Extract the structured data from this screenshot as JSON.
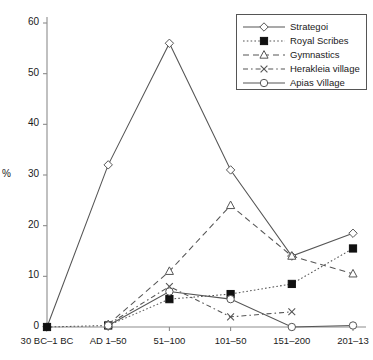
{
  "chart_data": {
    "type": "line",
    "title": "",
    "subtitle": "",
    "xlabel": "",
    "ylabel": "%",
    "ylim": [
      0,
      60
    ],
    "yticks": [
      0,
      10,
      20,
      30,
      40,
      50,
      60
    ],
    "grid": false,
    "legend_position": "top-right",
    "categories": [
      "30 BC–1 BC",
      "AD 1–50",
      "51–100",
      "101–50",
      "151–200",
      "201–13"
    ],
    "series": [
      {
        "name": "Strategoi",
        "marker": "open-diamond",
        "line": "solid",
        "values": [
          0,
          32,
          56,
          31,
          14,
          18.5
        ]
      },
      {
        "name": "Royal Scribes",
        "marker": "filled-square",
        "line": "dotted",
        "values": [
          0,
          0.3,
          5.5,
          6.5,
          8.5,
          15.5
        ]
      },
      {
        "name": "Gymnastics",
        "marker": "open-triangle",
        "line": "dashed",
        "values": [
          null,
          0.5,
          11,
          24,
          14,
          10.5
        ]
      },
      {
        "name": "Herakleia village",
        "marker": "cross-x",
        "line": "dash-dot",
        "values": [
          null,
          0.5,
          8,
          2,
          3,
          null
        ]
      },
      {
        "name": "Apias Village",
        "marker": "open-circle",
        "line": "solid",
        "values": [
          null,
          0.3,
          7,
          5.5,
          0,
          0.3
        ]
      }
    ],
    "colors": {
      "axis": "#8c8c8c",
      "text": "#1a1a1a",
      "series_line": "#555555",
      "background": "#ffffff",
      "legend_border": "#555555"
    }
  }
}
